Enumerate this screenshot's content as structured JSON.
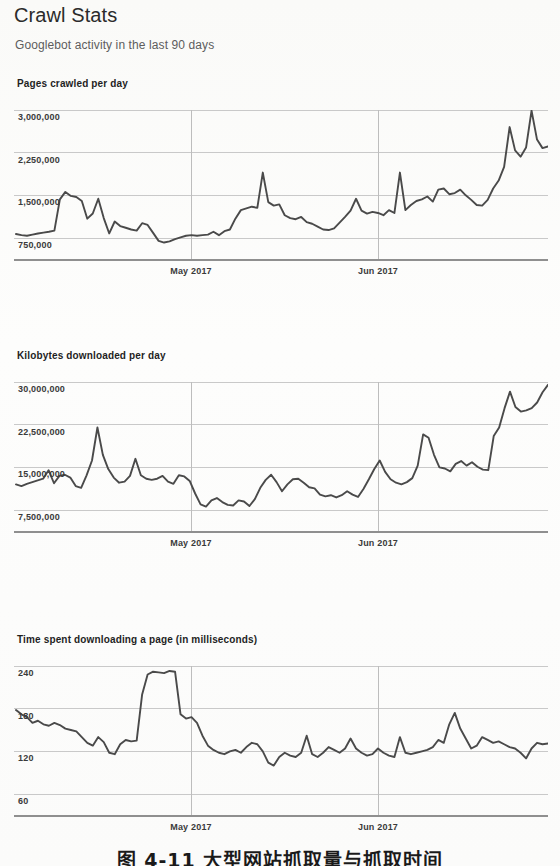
{
  "page": {
    "title": "Crawl Stats",
    "subtitle": "Googlebot activity in the last 90 days",
    "caption": "图 4-11  大型网站抓取量与抓取时间"
  },
  "axis": {
    "xticks": [
      {
        "label": "May 2017",
        "x": 191
      },
      {
        "label": "Jun 2017",
        "x": 378
      }
    ]
  },
  "charts": [
    {
      "id": "pages-crawled-per-day",
      "title": "Pages crawled per day",
      "yticks": [
        "3,000,000",
        "2,250,000",
        "1,500,000",
        "750,000"
      ]
    },
    {
      "id": "kilobytes-downloaded-per-day",
      "title": "Kilobytes downloaded per day",
      "yticks": [
        "30,000,000",
        "22,500,000",
        "15,000,000",
        "7,500,000"
      ]
    },
    {
      "id": "time-spent-downloading-a-page",
      "title": "Time spent downloading a page (in milliseconds)",
      "yticks": [
        "240",
        "180",
        "120",
        "60"
      ]
    }
  ],
  "chart_data": [
    {
      "type": "line",
      "title": "Pages crawled per day",
      "xlabel": "",
      "ylabel": "Pages crawled",
      "xticklabels": [
        "May 2017",
        "Jun 2017"
      ],
      "yticks": [
        750000,
        1500000,
        2250000,
        3000000
      ],
      "ylim": [
        0,
        3375000
      ],
      "grid": true,
      "legend": false,
      "values": [
        820000,
        800000,
        790000,
        810000,
        830000,
        845000,
        860000,
        880000,
        1430000,
        1560000,
        1490000,
        1470000,
        1400000,
        1090000,
        1180000,
        1440000,
        1100000,
        830000,
        1040000,
        960000,
        930000,
        900000,
        880000,
        1010000,
        980000,
        840000,
        700000,
        670000,
        690000,
        730000,
        760000,
        790000,
        800000,
        790000,
        800000,
        810000,
        860000,
        800000,
        870000,
        900000,
        1090000,
        1240000,
        1270000,
        1300000,
        1280000,
        1900000,
        1380000,
        1320000,
        1340000,
        1150000,
        1100000,
        1080000,
        1120000,
        1030000,
        1000000,
        950000,
        900000,
        890000,
        920000,
        1020000,
        1120000,
        1230000,
        1440000,
        1230000,
        1180000,
        1210000,
        1190000,
        1150000,
        1240000,
        1190000,
        1900000,
        1240000,
        1330000,
        1400000,
        1430000,
        1480000,
        1390000,
        1600000,
        1620000,
        1520000,
        1540000,
        1600000,
        1500000,
        1420000,
        1330000,
        1320000,
        1420000,
        1620000,
        1760000,
        2000000,
        2700000,
        2290000,
        2180000,
        2340000,
        2990000,
        2480000,
        2330000,
        2360000
      ]
    },
    {
      "type": "line",
      "title": "Kilobytes downloaded per day",
      "xlabel": "",
      "ylabel": "Kilobytes downloaded",
      "xticklabels": [
        "May 2017",
        "Jun 2017"
      ],
      "yticks": [
        7500000,
        15000000,
        22500000,
        30000000
      ],
      "ylim": [
        0,
        33750000
      ],
      "grid": true,
      "legend": false,
      "values": [
        12000000,
        11700000,
        12100000,
        12400000,
        12700000,
        13000000,
        14500000,
        12200000,
        13500000,
        13700000,
        13200000,
        11700000,
        11400000,
        13600000,
        16200000,
        22000000,
        17200000,
        14700000,
        13200000,
        12300000,
        12500000,
        13500000,
        16500000,
        13600000,
        13000000,
        12800000,
        13000000,
        13500000,
        12500000,
        12100000,
        13600000,
        13400000,
        12600000,
        10400000,
        8500000,
        8100000,
        9200000,
        9600000,
        8900000,
        8400000,
        8300000,
        9200000,
        9000000,
        8200000,
        9400000,
        11400000,
        12800000,
        13700000,
        12400000,
        10800000,
        12000000,
        12900000,
        13000000,
        12300000,
        11500000,
        11300000,
        10200000,
        9900000,
        10100000,
        9700000,
        10100000,
        10800000,
        10200000,
        9800000,
        11200000,
        12900000,
        14700000,
        16200000,
        14200000,
        12900000,
        12300000,
        12000000,
        12400000,
        13100000,
        15300000,
        20800000,
        20200000,
        17200000,
        15000000,
        14800000,
        14300000,
        15600000,
        16100000,
        15300000,
        15900000,
        15100000,
        14600000,
        14500000,
        20500000,
        22000000,
        25400000,
        28300000,
        25600000,
        24800000,
        25000000,
        25400000,
        26400000,
        28200000,
        29500000
      ]
    },
    {
      "type": "line",
      "title": "Time spent downloading a page (in milliseconds)",
      "xlabel": "",
      "ylabel": "Milliseconds",
      "xticklabels": [
        "May 2017",
        "Jun 2017"
      ],
      "yticks": [
        60,
        120,
        180,
        240
      ],
      "ylim": [
        0,
        270
      ],
      "grid": true,
      "legend": false,
      "values": [
        178,
        172,
        168,
        160,
        163,
        158,
        156,
        160,
        157,
        152,
        150,
        148,
        140,
        132,
        128,
        140,
        133,
        118,
        116,
        130,
        136,
        134,
        135,
        200,
        228,
        232,
        231,
        230,
        233,
        232,
        172,
        166,
        168,
        160,
        142,
        128,
        122,
        118,
        116,
        120,
        122,
        118,
        126,
        132,
        130,
        120,
        104,
        100,
        112,
        118,
        114,
        112,
        118,
        142,
        116,
        112,
        118,
        126,
        122,
        118,
        124,
        138,
        124,
        118,
        114,
        116,
        124,
        118,
        114,
        112,
        140,
        118,
        116,
        118,
        120,
        122,
        126,
        136,
        132,
        158,
        174,
        152,
        138,
        124,
        128,
        140,
        136,
        132,
        134,
        130,
        126,
        124,
        118,
        110,
        124,
        132,
        130,
        131
      ]
    }
  ]
}
